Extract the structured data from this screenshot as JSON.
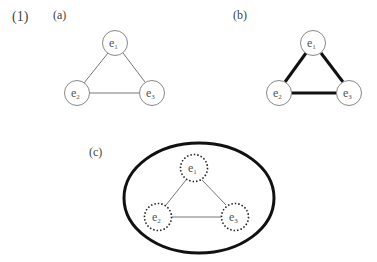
{
  "figure": {
    "number_label": "(1)",
    "panels": [
      {
        "label": "(a)",
        "style": "thin-edges",
        "nodes": [
          {
            "name": "e",
            "sub": "1",
            "cx": 115,
            "cy": 43
          },
          {
            "name": "e",
            "sub": "2",
            "cx": 77,
            "cy": 93
          },
          {
            "name": "e",
            "sub": "3",
            "cx": 152,
            "cy": 93
          }
        ]
      },
      {
        "label": "(b)",
        "style": "thick-edges",
        "nodes": [
          {
            "name": "e",
            "sub": "1",
            "cx": 313,
            "cy": 43
          },
          {
            "name": "e",
            "sub": "2",
            "cx": 279,
            "cy": 93
          },
          {
            "name": "e",
            "sub": "3",
            "cx": 349,
            "cy": 93
          }
        ]
      },
      {
        "label": "(c)",
        "style": "dotted-nodes-in-ellipse",
        "nodes": [
          {
            "name": "e",
            "sub": "1",
            "cx": 194,
            "cy": 168
          },
          {
            "name": "e",
            "sub": "2",
            "cx": 158,
            "cy": 217
          },
          {
            "name": "e",
            "sub": "3",
            "cx": 235,
            "cy": 217
          }
        ]
      }
    ]
  }
}
